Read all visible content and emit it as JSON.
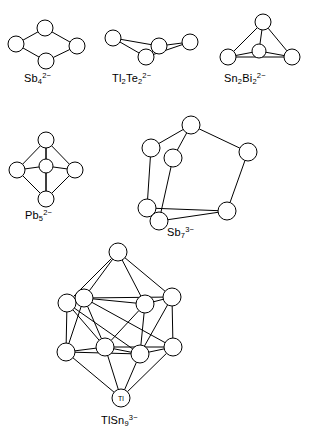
{
  "figure": {
    "kind": "chemical-structure-diagram",
    "background_color": "#ffffff",
    "line_color": "#000000",
    "atom_fill": "#ffffff"
  },
  "clusters": [
    {
      "id": "sb4",
      "name": "tetraantimony-dianion",
      "formula": {
        "base1": "Sb",
        "sub1": "4",
        "charge": "2−"
      },
      "label_text": "Sb4 2−",
      "shape": "rhombus",
      "atom_count": 4,
      "atoms": [
        {
          "cx": 16,
          "cy": 44,
          "r": 8
        },
        {
          "cx": 45,
          "cy": 28,
          "r": 8
        },
        {
          "cx": 77,
          "cy": 46,
          "r": 8
        },
        {
          "cx": 46,
          "cy": 61,
          "r": 8
        }
      ],
      "bonds": [
        [
          0,
          1
        ],
        [
          1,
          2
        ],
        [
          2,
          3
        ],
        [
          3,
          0
        ]
      ],
      "label_pos": {
        "left": 24,
        "top": 72
      }
    },
    {
      "id": "tl2te2",
      "name": "dithallium-ditelluride-dianion",
      "formula": {
        "base1": "Tl",
        "sub1": "2",
        "base2": "Te",
        "sub2": "2",
        "charge": "2−"
      },
      "label_text": "Tl2Te2 2−",
      "shape": "butterfly",
      "atom_count": 4,
      "atoms": [
        {
          "cx": 113,
          "cy": 38,
          "r": 8
        },
        {
          "cx": 159,
          "cy": 46,
          "r": 8
        },
        {
          "cx": 190,
          "cy": 42,
          "r": 8
        },
        {
          "cx": 146,
          "cy": 57,
          "r": 8
        }
      ],
      "bonds": [
        [
          0,
          1
        ],
        [
          1,
          2
        ],
        [
          0,
          3
        ],
        [
          3,
          1
        ],
        [
          3,
          2
        ]
      ],
      "label_pos": {
        "left": 112,
        "top": 72
      }
    },
    {
      "id": "sn2bi2",
      "name": "ditin-dibismuth-dianion",
      "formula": {
        "base1": "Sn",
        "sub1": "2",
        "base2": "Bi",
        "sub2": "2",
        "charge": "2−"
      },
      "label_text": "Sn2Bi2 2−",
      "shape": "tetrahedron",
      "atom_count": 4,
      "atoms": [
        {
          "cx": 263,
          "cy": 22,
          "r": 8
        },
        {
          "cx": 228,
          "cy": 57,
          "r": 8
        },
        {
          "cx": 292,
          "cy": 57,
          "r": 8
        },
        {
          "cx": 259,
          "cy": 51,
          "r": 7
        }
      ],
      "bonds": [
        [
          0,
          1
        ],
        [
          0,
          2
        ],
        [
          1,
          2
        ],
        [
          0,
          3
        ],
        [
          1,
          3
        ],
        [
          2,
          3
        ]
      ],
      "label_pos": {
        "left": 224,
        "top": 72
      }
    },
    {
      "id": "pb5",
      "name": "pentalead-dianion",
      "formula": {
        "base1": "Pb",
        "sub1": "5",
        "charge": "2−"
      },
      "label_text": "Pb5 2−",
      "shape": "trigonal-bipyramid",
      "atom_count": 5,
      "atoms": [
        {
          "cx": 46,
          "cy": 140,
          "r": 8
        },
        {
          "cx": 17,
          "cy": 170,
          "r": 8
        },
        {
          "cx": 75,
          "cy": 170,
          "r": 8
        },
        {
          "cx": 46,
          "cy": 166,
          "r": 7
        },
        {
          "cx": 46,
          "cy": 199,
          "r": 8
        }
      ],
      "bonds": [
        [
          0,
          1
        ],
        [
          0,
          2
        ],
        [
          0,
          3
        ],
        [
          0,
          4
        ],
        [
          1,
          3
        ],
        [
          3,
          2
        ],
        [
          1,
          4
        ],
        [
          2,
          4
        ],
        [
          3,
          4
        ]
      ],
      "label_pos": {
        "left": 25,
        "top": 209
      }
    },
    {
      "id": "sb7",
      "name": "heptaantimony-trianion",
      "formula": {
        "base1": "Sb",
        "sub1": "7",
        "charge": "3−"
      },
      "label_text": "Sb7 3−",
      "shape": "nortricyclane",
      "atom_count": 7,
      "atoms": [
        {
          "cx": 191,
          "cy": 125,
          "r": 9
        },
        {
          "cx": 151,
          "cy": 148,
          "r": 9
        },
        {
          "cx": 248,
          "cy": 152,
          "r": 9
        },
        {
          "cx": 173,
          "cy": 158,
          "r": 9
        },
        {
          "cx": 147,
          "cy": 208,
          "r": 9
        },
        {
          "cx": 159,
          "cy": 221,
          "r": 9
        },
        {
          "cx": 227,
          "cy": 211,
          "r": 9
        }
      ],
      "bonds": [
        [
          0,
          1
        ],
        [
          0,
          2
        ],
        [
          0,
          3
        ],
        [
          1,
          4
        ],
        [
          2,
          6
        ],
        [
          3,
          5
        ],
        [
          4,
          5
        ],
        [
          4,
          6
        ],
        [
          5,
          6
        ]
      ],
      "label_pos": {
        "left": 167,
        "top": 226
      }
    },
    {
      "id": "tlsn9",
      "name": "thallium-nonatin-trianion",
      "formula": {
        "base1": "TlSn",
        "sub1": "9",
        "charge": "3−"
      },
      "label_text": "TlSn9 3−",
      "shape": "tricapped-trigonal-prism",
      "atom_count": 10,
      "atom_labels": {
        "9": "Tl"
      },
      "atoms": [
        {
          "cx": 118,
          "cy": 252,
          "r": 9
        },
        {
          "cx": 84,
          "cy": 298,
          "r": 9
        },
        {
          "cx": 67,
          "cy": 303,
          "r": 9
        },
        {
          "cx": 145,
          "cy": 304,
          "r": 9
        },
        {
          "cx": 172,
          "cy": 297,
          "r": 9
        },
        {
          "cx": 66,
          "cy": 352,
          "r": 9
        },
        {
          "cx": 105,
          "cy": 347,
          "r": 9
        },
        {
          "cx": 140,
          "cy": 354,
          "r": 9
        },
        {
          "cx": 173,
          "cy": 347,
          "r": 9
        },
        {
          "cx": 121,
          "cy": 398,
          "r": 9
        }
      ],
      "bonds": [
        [
          0,
          1
        ],
        [
          0,
          2
        ],
        [
          0,
          3
        ],
        [
          0,
          4
        ],
        [
          1,
          2
        ],
        [
          1,
          3
        ],
        [
          3,
          4
        ],
        [
          1,
          4
        ],
        [
          2,
          5
        ],
        [
          1,
          6
        ],
        [
          3,
          7
        ],
        [
          4,
          8
        ],
        [
          2,
          6
        ],
        [
          1,
          5
        ],
        [
          3,
          6
        ],
        [
          4,
          7
        ],
        [
          2,
          7
        ],
        [
          1,
          8
        ],
        [
          5,
          6
        ],
        [
          6,
          7
        ],
        [
          7,
          8
        ],
        [
          5,
          7
        ],
        [
          6,
          8
        ],
        [
          5,
          9
        ],
        [
          6,
          9
        ],
        [
          7,
          9
        ],
        [
          8,
          9
        ]
      ],
      "label_pos": {
        "left": 101,
        "top": 414
      }
    }
  ]
}
